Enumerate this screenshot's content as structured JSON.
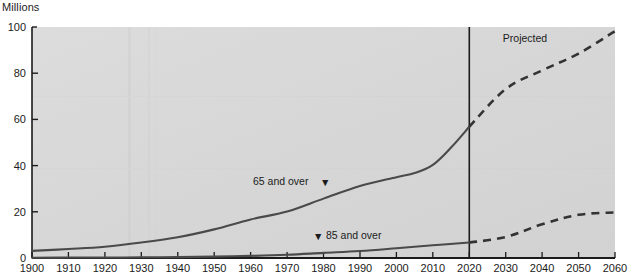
{
  "units_label": "Millions",
  "annotations": {
    "projected": "Projected",
    "series_65_label": "65 and over",
    "series_85_label": "85 and over",
    "marker_glyph": "▼"
  },
  "colors": {
    "plot_background": "#d6d6d6",
    "axis": "#1b1b1b",
    "series_line": "#4a4a4a",
    "divider": "#1b1b1b",
    "page_background": "#ffffff",
    "text": "#1b1b1b"
  },
  "chart_data": {
    "type": "line",
    "title": "",
    "subtitle": "",
    "xlabel": "",
    "ylabel": "Millions",
    "xlim": [
      1900,
      2060
    ],
    "ylim": [
      0,
      100
    ],
    "grid": false,
    "legend_position": "inline-annotations",
    "xticks": [
      1900,
      1910,
      1920,
      1930,
      1940,
      1950,
      1960,
      1970,
      1980,
      1990,
      2000,
      2010,
      2020,
      2030,
      2040,
      2050,
      2060
    ],
    "yticks": [
      0,
      20,
      40,
      60,
      80,
      100
    ],
    "projection_start_year": 2020,
    "projection_divider_label": "Projected",
    "series": [
      {
        "name": "65 and over",
        "style_historical": "solid",
        "style_projected": "dashed",
        "x": [
          1900,
          1910,
          1920,
          1930,
          1940,
          1950,
          1960,
          1970,
          1980,
          1990,
          2000,
          2005,
          2010,
          2015,
          2020,
          2030,
          2040,
          2050,
          2060
        ],
        "values": [
          3.1,
          3.9,
          4.9,
          6.7,
          9.0,
          12.4,
          16.7,
          20.1,
          25.7,
          31.2,
          35.0,
          36.8,
          40.3,
          47.8,
          56.8,
          73.1,
          81.2,
          88.5,
          98.2
        ]
      },
      {
        "name": "85 and over",
        "style_historical": "solid",
        "style_projected": "dashed",
        "x": [
          1900,
          1910,
          1920,
          1930,
          1940,
          1950,
          1960,
          1970,
          1980,
          1990,
          2000,
          2010,
          2020,
          2030,
          2040,
          2050,
          2060
        ],
        "values": [
          0.1,
          0.2,
          0.2,
          0.3,
          0.4,
          0.6,
          0.9,
          1.4,
          2.2,
          3.0,
          4.2,
          5.5,
          6.7,
          9.1,
          14.6,
          18.7,
          19.7
        ]
      }
    ]
  }
}
